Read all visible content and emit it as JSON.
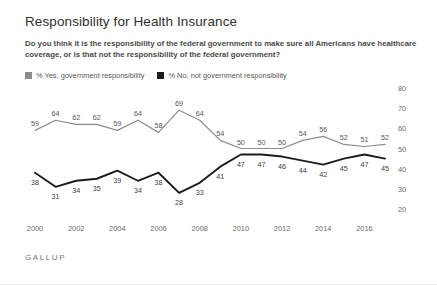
{
  "header": {
    "title": "Responsibility for Health Insurance",
    "subtitle": "Do you think it is the responsibility of the federal government to make sure all Americans have healthcare coverage, or is that not the responsibility of the federal government?"
  },
  "brand": "GALLUP",
  "legend": [
    {
      "label": "% Yes, government responsibility",
      "color": "#8c8c8c"
    },
    {
      "label": "% No, not government responsibility",
      "color": "#1c1c1c"
    }
  ],
  "chart_data": {
    "type": "line",
    "title": "Responsibility for Health Insurance",
    "xlabel": "",
    "ylabel": "",
    "ylim": [
      20,
      80
    ],
    "yticks": [
      80,
      70,
      60,
      50,
      40,
      30,
      20
    ],
    "xticks": [
      "2000",
      "2002",
      "2004",
      "2006",
      "2008",
      "2010",
      "2012",
      "2014",
      "2016"
    ],
    "x": [
      2000,
      2001,
      2002,
      2003,
      2004,
      2005,
      2006,
      2007,
      2008,
      2009,
      2010,
      2011,
      2012,
      2013,
      2014,
      2015,
      2016,
      2017
    ],
    "grid": false,
    "legend_position": "top-left",
    "series": [
      {
        "name": "% Yes, government responsibility",
        "color": "#8c8c8c",
        "values": [
          59,
          64,
          62,
          62,
          59,
          64,
          58,
          69,
          64,
          54,
          50,
          50,
          50,
          54,
          56,
          52,
          51,
          52
        ]
      },
      {
        "name": "% No, not government responsibility",
        "color": "#1c1c1c",
        "values": [
          38,
          31,
          34,
          35,
          39,
          34,
          38,
          28,
          33,
          41,
          47,
          47,
          46,
          44,
          42,
          45,
          47,
          45
        ]
      }
    ]
  }
}
